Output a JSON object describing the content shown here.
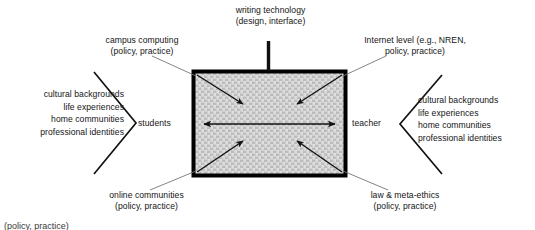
{
  "figure": {
    "type": "concept-diagram",
    "background_color": "#ffffff",
    "ink_color": "#141414",
    "connector_color": "#6e6e6e",
    "box_fill_color": "#c9c9c9",
    "box_border_color": "#000000"
  },
  "center_box": {
    "name": "interaction-space",
    "fill": "#c9c9c9",
    "texture": "woven-mesh"
  },
  "top_node": {
    "line1": "writing technology",
    "line2": "(design, interface)"
  },
  "corner_nodes": {
    "top_left": {
      "line1": "campus computing",
      "line2": "(policy, practice)"
    },
    "top_right": {
      "line1": "Internet level (e.g., NREN,",
      "line2": "policy, practice)"
    },
    "bottom_left": {
      "line1": "online communities",
      "line2": "(policy, practice)"
    },
    "bottom_right": {
      "line1": "law & meta-ethics",
      "line2": "(policy, practice)"
    }
  },
  "actors": {
    "left": {
      "label": "students",
      "attributes": [
        "cultural backgrounds",
        "life experiences",
        "home communities",
        "professional identities"
      ]
    },
    "right": {
      "label": "teacher",
      "attributes": [
        "cultural backgrounds",
        "life experiences",
        "home communities",
        "professional identities"
      ]
    }
  },
  "caption": {
    "text": "(policy, practice)"
  }
}
